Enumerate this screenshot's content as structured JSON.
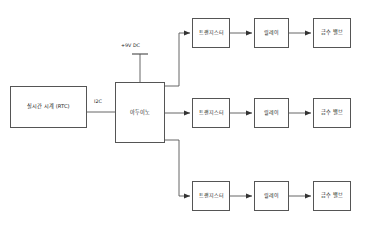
{
  "diagram": {
    "type": "block-diagram",
    "title": "",
    "background": "#ffffff",
    "line_color": "#555555",
    "text_color": "#222222",
    "nodes": {
      "rtc": {
        "label": "실시간 시계 (RTC)"
      },
      "arduino": {
        "label": "아두이노"
      },
      "chains": [
        {
          "transistor": "트랜지스터",
          "relay": "릴레이",
          "valve": "급수 밸브"
        },
        {
          "transistor": "트랜지스터",
          "relay": "릴레이",
          "valve": "급수 밸브"
        },
        {
          "transistor": "트랜지스터",
          "relay": "릴레이",
          "valve": "급수 밸브"
        }
      ]
    },
    "edge_labels": {
      "i2c": "I2C",
      "power": "+9V DC"
    }
  }
}
